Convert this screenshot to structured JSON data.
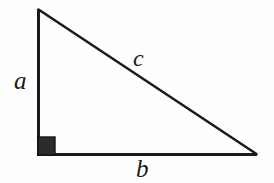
{
  "figure": {
    "name": "right-triangle-diagram",
    "background_color": "#fefefe",
    "stroke_color": "#1b1b1b",
    "right_angle_fill_color": "#2b2b2b"
  },
  "labels": {
    "leg_vertical": "a",
    "leg_horizontal": "b",
    "hypotenuse": "c"
  },
  "geometry": {
    "vertices": {
      "apex": [
        38,
        9
      ],
      "right_angle": [
        38,
        155
      ],
      "bottom_right": [
        257,
        155
      ]
    },
    "right_angle_marker": {
      "x": 38,
      "y": 137,
      "width": 17,
      "height": 18
    },
    "stroke_width": 3
  }
}
